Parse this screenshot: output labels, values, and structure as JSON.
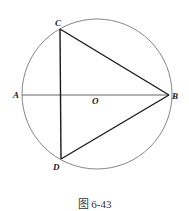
{
  "figure": {
    "caption": "图 6-43",
    "labels": {
      "A": "A",
      "B": "B",
      "C": "C",
      "D": "D",
      "O": "O"
    },
    "colors": {
      "circle": "#777777",
      "lines": "#1a1a1a",
      "diameter": "#555555"
    }
  }
}
